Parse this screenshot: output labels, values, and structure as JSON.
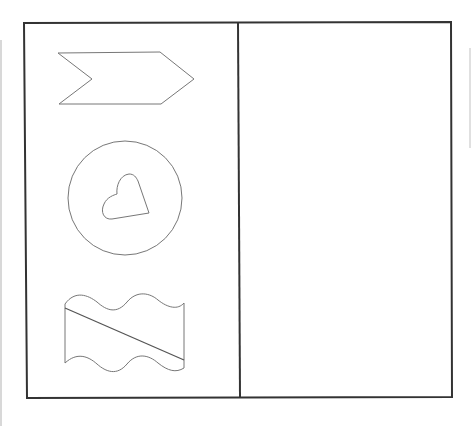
{
  "diagram": {
    "frame": {
      "stroke": "#333333"
    },
    "panels": [
      {
        "name": "left-panel",
        "shapes": [
          "chevron-arrow",
          "circle-with-heart",
          "wavy-rectangle-with-diagonal"
        ]
      },
      {
        "name": "right-panel",
        "shapes": []
      }
    ],
    "shape_stroke": "#777777"
  }
}
